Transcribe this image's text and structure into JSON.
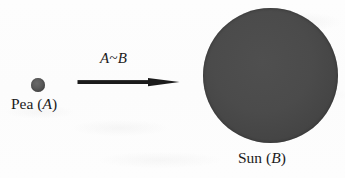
{
  "figure": {
    "background_color": "#fdfdfd",
    "width": 345,
    "height": 178,
    "bodies": {
      "pea": {
        "name": "pea-body",
        "label_text": "Pea",
        "symbol": "A",
        "open_paren": "(",
        "close_paren": ")",
        "fill_color": "#4a4a4a",
        "rim_color": "#333333",
        "center_x": 38,
        "center_y": 85,
        "diameter": 14
      },
      "sun": {
        "name": "sun-body",
        "label_text": "Sun",
        "symbol": "B",
        "open_paren": "(",
        "close_paren": ")",
        "fill_color": "#4a4a4a",
        "rim_color": "#373737",
        "center_x": 270,
        "center_y": 75,
        "diameter": 135
      }
    },
    "relation": {
      "name": "relation-arrow",
      "label": "A~B",
      "left_symbol": "A",
      "operator": "~",
      "right_symbol": "B",
      "direction": "left-to-right",
      "color": "#1b1b1b",
      "start_x": 78,
      "end_x": 178,
      "y": 82
    }
  }
}
